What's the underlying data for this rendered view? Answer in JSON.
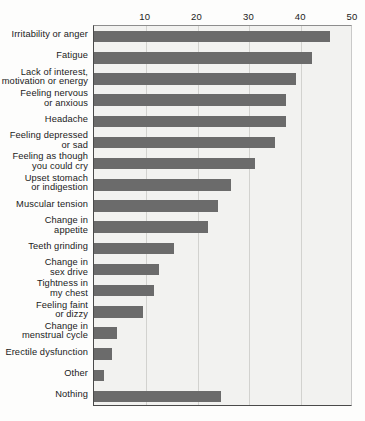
{
  "chart_data": {
    "type": "bar",
    "orientation": "horizontal",
    "title": "",
    "subtitle": "",
    "xlabel": "",
    "ylabel": "",
    "xlim": [
      0,
      50
    ],
    "ylim": null,
    "grid": true,
    "legend": null,
    "legend_position": "none",
    "xticks": [
      10,
      20,
      30,
      40,
      50
    ],
    "xtick_labels": [
      "10",
      "20",
      "30",
      "40",
      "50"
    ],
    "bar_color": "#6b6b6b",
    "plot_background": "#f2f2f0",
    "categories": [
      "Irritability or anger",
      "Fatigue",
      "Lack of interest,\nmotivation or energy",
      "Feeling nervous\nor anxious",
      "Headache",
      "Feeling depressed\nor sad",
      "Feeling as though\nyou could cry",
      "Upset stomach\nor indigestion",
      "Muscular tension",
      "Change in\nappetite",
      "Teeth grinding",
      "Change in\nsex drive",
      "Tightness in\nmy chest",
      "Feeling faint\nor dizzy",
      "Change in\nmenstrual cycle",
      "Erectile dysfunction",
      "Other",
      "Nothing"
    ],
    "values": [
      45.5,
      42,
      39,
      37,
      37,
      35,
      31,
      26.5,
      24,
      22,
      15.5,
      12.5,
      11.5,
      9.5,
      4.5,
      3.5,
      2,
      24.5
    ]
  }
}
